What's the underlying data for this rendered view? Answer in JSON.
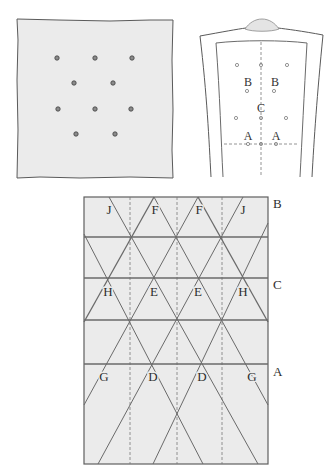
{
  "garment": {
    "labels": {
      "b_left": "B",
      "b_right": "B",
      "c": "C",
      "a_left": "A",
      "a_right": "A"
    }
  },
  "lattice": {
    "top_labels": [
      "J",
      "F",
      "F",
      "J"
    ],
    "middle_labels": [
      "H",
      "E",
      "E",
      "H"
    ],
    "lower_labels": [
      "G",
      "D",
      "D",
      "G"
    ],
    "row_labels": {
      "top": "B",
      "middle": "C",
      "lower": "A"
    }
  }
}
